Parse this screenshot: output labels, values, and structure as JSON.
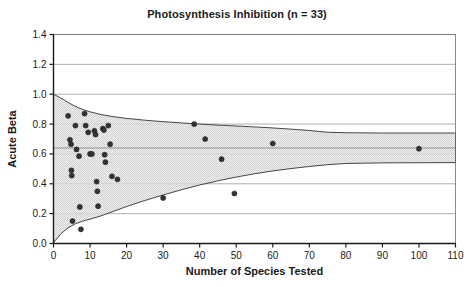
{
  "chart_data": {
    "type": "scatter",
    "title": "Photosynthesis Inhibition (n = 33)",
    "xlabel": "Number of Species Tested",
    "ylabel": "Acute Beta",
    "xlim": [
      0,
      110
    ],
    "ylim": [
      0.0,
      1.4
    ],
    "xticks": [
      0,
      10,
      20,
      30,
      40,
      50,
      60,
      70,
      80,
      90,
      100,
      110
    ],
    "yticks": [
      "0.0",
      "0.2",
      "0.4",
      "0.6",
      "0.8",
      "1.0",
      "1.2",
      "1.4"
    ],
    "ytick_values": [
      0.0,
      0.2,
      0.4,
      0.6,
      0.8,
      1.0,
      1.2,
      1.4
    ],
    "grid": "horizontal",
    "legend": "none",
    "n": 33,
    "series": [
      {
        "name": "Acute Beta by number of species tested",
        "marker": "filled-circle",
        "marker_color": "#333333",
        "points": [
          [
            4.0,
            0.855
          ],
          [
            4.5,
            0.695
          ],
          [
            4.8,
            0.665
          ],
          [
            4.9,
            0.49
          ],
          [
            5.0,
            0.455
          ],
          [
            5.2,
            0.15
          ],
          [
            6.0,
            0.79
          ],
          [
            6.3,
            0.63
          ],
          [
            7.0,
            0.585
          ],
          [
            7.2,
            0.245
          ],
          [
            7.5,
            0.095
          ],
          [
            8.5,
            0.87
          ],
          [
            8.8,
            0.79
          ],
          [
            9.5,
            0.745
          ],
          [
            10.0,
            0.6
          ],
          [
            10.5,
            0.6
          ],
          [
            11.2,
            0.755
          ],
          [
            11.5,
            0.73
          ],
          [
            11.8,
            0.415
          ],
          [
            12.0,
            0.35
          ],
          [
            12.2,
            0.25
          ],
          [
            13.5,
            0.77
          ],
          [
            13.8,
            0.76
          ],
          [
            14.0,
            0.595
          ],
          [
            14.2,
            0.545
          ],
          [
            15.0,
            0.79
          ],
          [
            15.5,
            0.665
          ],
          [
            16.0,
            0.45
          ],
          [
            17.5,
            0.43
          ],
          [
            30.0,
            0.305
          ],
          [
            38.5,
            0.8
          ],
          [
            41.5,
            0.7
          ],
          [
            46.0,
            0.565
          ],
          [
            49.5,
            0.335
          ],
          [
            60.0,
            0.67
          ],
          [
            100.0,
            0.635
          ]
        ]
      }
    ],
    "funnel": {
      "fill": "#c8c8c8",
      "stroke": "#333333",
      "center": 0.64,
      "upper": [
        [
          0.0,
          1.0
        ],
        [
          2.0,
          0.975
        ],
        [
          4.0,
          0.945
        ],
        [
          6.0,
          0.918
        ],
        [
          8.0,
          0.898
        ],
        [
          10.0,
          0.882
        ],
        [
          13.0,
          0.864
        ],
        [
          16.0,
          0.851
        ],
        [
          20.0,
          0.838
        ],
        [
          25.0,
          0.826
        ],
        [
          30.0,
          0.816
        ],
        [
          35.0,
          0.808
        ],
        [
          40.0,
          0.8
        ],
        [
          45.0,
          0.793
        ],
        [
          50.0,
          0.787
        ],
        [
          55.0,
          0.781
        ],
        [
          60.0,
          0.774
        ],
        [
          65.0,
          0.766
        ],
        [
          70.0,
          0.757
        ],
        [
          75.0,
          0.745
        ],
        [
          80.0,
          0.742
        ],
        [
          90.0,
          0.74
        ],
        [
          100.0,
          0.74
        ],
        [
          110.0,
          0.74
        ]
      ],
      "lower": [
        [
          0.0,
          0.005
        ],
        [
          2.0,
          0.065
        ],
        [
          4.0,
          0.105
        ],
        [
          6.0,
          0.132
        ],
        [
          8.0,
          0.15
        ],
        [
          10.0,
          0.163
        ],
        [
          13.0,
          0.185
        ],
        [
          16.0,
          0.212
        ],
        [
          20.0,
          0.248
        ],
        [
          25.0,
          0.288
        ],
        [
          30.0,
          0.325
        ],
        [
          35.0,
          0.36
        ],
        [
          40.0,
          0.392
        ],
        [
          45.0,
          0.42
        ],
        [
          50.0,
          0.445
        ],
        [
          55.0,
          0.467
        ],
        [
          60.0,
          0.486
        ],
        [
          65.0,
          0.502
        ],
        [
          70.0,
          0.516
        ],
        [
          75.0,
          0.528
        ],
        [
          80.0,
          0.536
        ],
        [
          90.0,
          0.54
        ],
        [
          100.0,
          0.541
        ],
        [
          110.0,
          0.542
        ]
      ]
    }
  }
}
